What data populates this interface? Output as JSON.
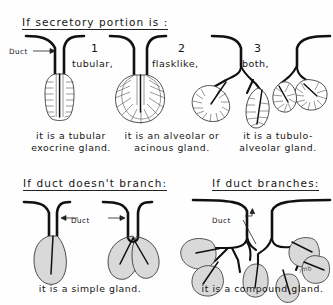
{
  "figure": {
    "kind": "hand-drawn-histology-diagram",
    "topic": "Classification of exocrine glands"
  },
  "sections": [
    {
      "heading": "If secretory portion is :",
      "duct_label": "Duct",
      "columns": [
        {
          "number": "1",
          "kind": "tubular,",
          "caption_line1": "it is a tubular",
          "caption_line2": "exocrine gland."
        },
        {
          "number": "2",
          "kind": "flasklike,",
          "caption_line1": "it is an alveolar or",
          "caption_line2": "acinous gland."
        },
        {
          "number": "3",
          "kind": "both,",
          "caption_line1": "it is a tubulo-",
          "caption_line2": "alveolar gland."
        }
      ]
    },
    {
      "headings": [
        "If duct doesn't branch:",
        "If duct branches:"
      ],
      "duct_label_left": "Duct",
      "duct_label_right": "Duct",
      "captions": [
        "it is a simple gland.",
        "it is a compound gland."
      ],
      "signature": "jmb"
    }
  ],
  "colors": {
    "ink": "#111111",
    "paper": "#fefefe",
    "cell_outline": "#444444"
  }
}
